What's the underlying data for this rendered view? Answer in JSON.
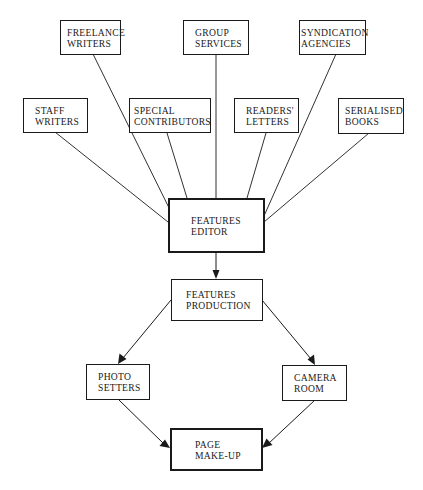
{
  "diagram": {
    "sources": [
      {
        "id": "freelance",
        "line1": "FREELANCE",
        "line2": "WRITERS"
      },
      {
        "id": "group",
        "line1": "GROUP",
        "line2": "SERVICES"
      },
      {
        "id": "syndication",
        "line1": "SYNDICATION",
        "line2": "AGENCIES"
      },
      {
        "id": "staff",
        "line1": "STAFF",
        "line2": "WRITERS"
      },
      {
        "id": "special",
        "line1": "SPECIAL",
        "line2": "CONTRIBUTORS"
      },
      {
        "id": "readers",
        "line1": "READERS'",
        "line2": "LETTERS"
      },
      {
        "id": "serialised",
        "line1": "SERIALISED",
        "line2": "BOOKS"
      }
    ],
    "hub": {
      "id": "features_editor",
      "line1": "FEATURES",
      "line2": "EDITOR"
    },
    "production": {
      "id": "features_production",
      "line1": "FEATURES",
      "line2": "PRODUCTION"
    },
    "branches": [
      {
        "id": "photo_setters",
        "line1": "PHOTO",
        "line2": "SETTERS"
      },
      {
        "id": "camera_room",
        "line1": "CAMERA",
        "line2": "ROOM"
      }
    ],
    "sink": {
      "id": "page_makeup",
      "line1": "PAGE",
      "line2": "MAKE-UP"
    },
    "edges": [
      {
        "from": "freelance",
        "to": "features_editor",
        "arrow": false
      },
      {
        "from": "group",
        "to": "features_editor",
        "arrow": false
      },
      {
        "from": "syndication",
        "to": "features_editor",
        "arrow": false
      },
      {
        "from": "staff",
        "to": "features_editor",
        "arrow": false
      },
      {
        "from": "special",
        "to": "features_editor",
        "arrow": false
      },
      {
        "from": "readers",
        "to": "features_editor",
        "arrow": false
      },
      {
        "from": "serialised",
        "to": "features_editor",
        "arrow": false
      },
      {
        "from": "features_editor",
        "to": "features_production",
        "arrow": true
      },
      {
        "from": "features_production",
        "to": "photo_setters",
        "arrow": true
      },
      {
        "from": "features_production",
        "to": "camera_room",
        "arrow": true
      },
      {
        "from": "photo_setters",
        "to": "page_makeup",
        "arrow": true
      },
      {
        "from": "camera_room",
        "to": "page_makeup",
        "arrow": true
      }
    ]
  }
}
